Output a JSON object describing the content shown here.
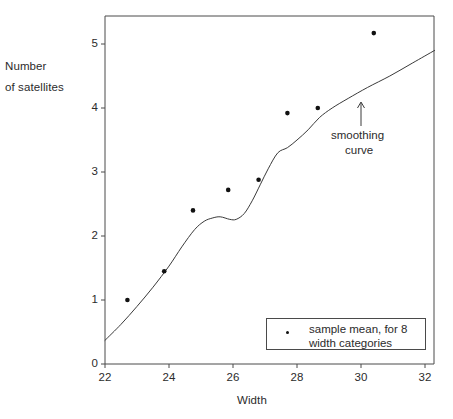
{
  "figure": {
    "background_color": "#ffffff",
    "frame_color": "#4a4a4a",
    "data_color": "#111111",
    "curve_color": "#3a3a3a"
  },
  "axes": {
    "y_title_line1": "Number",
    "y_title_line2": "of satellites",
    "x_title": "Width",
    "y_ticks": [
      "0",
      "1",
      "2",
      "3",
      "4",
      "5"
    ],
    "x_ticks": [
      "22",
      "24",
      "26",
      "28",
      "30",
      "32"
    ]
  },
  "annotation": {
    "line1": "smoothing",
    "line2": "curve",
    "arrow": "arrow-up"
  },
  "legend": {
    "marker": "dot-marker",
    "line1": "sample mean,  for 8",
    "line2": "width categories"
  },
  "chart_data": {
    "type": "scatter",
    "title": "",
    "xlabel": "Width",
    "ylabel": "Number of satellites",
    "xlim": [
      22,
      32.3
    ],
    "ylim": [
      0,
      5.55
    ],
    "grid": false,
    "legend_position": "lower-right",
    "series": [
      {
        "name": "sample mean,  for 8 width categories",
        "type": "scatter",
        "marker": "filled-circle",
        "color": "#111111",
        "x": [
          22.7,
          23.85,
          24.75,
          25.85,
          26.8,
          27.7,
          28.65,
          30.4
        ],
        "y": [
          1.0,
          1.45,
          2.4,
          2.72,
          2.88,
          3.92,
          4.0,
          5.17
        ]
      },
      {
        "name": "smoothing curve",
        "type": "line",
        "color": "#3a3a3a",
        "x": [
          22.0,
          22.5,
          23.0,
          23.5,
          24.0,
          24.4,
          24.8,
          25.1,
          25.35,
          25.6,
          25.9,
          26.1,
          26.35,
          26.6,
          26.85,
          27.1,
          27.4,
          27.7,
          28.0,
          28.35,
          28.7,
          29.1,
          29.6,
          30.2,
          30.9,
          31.6,
          32.3
        ],
        "y": [
          0.37,
          0.62,
          0.9,
          1.2,
          1.53,
          1.83,
          2.1,
          2.23,
          2.28,
          2.3,
          2.26,
          2.26,
          2.35,
          2.55,
          2.8,
          3.05,
          3.3,
          3.38,
          3.5,
          3.66,
          3.85,
          4.0,
          4.15,
          4.32,
          4.5,
          4.7,
          4.9
        ]
      }
    ]
  }
}
